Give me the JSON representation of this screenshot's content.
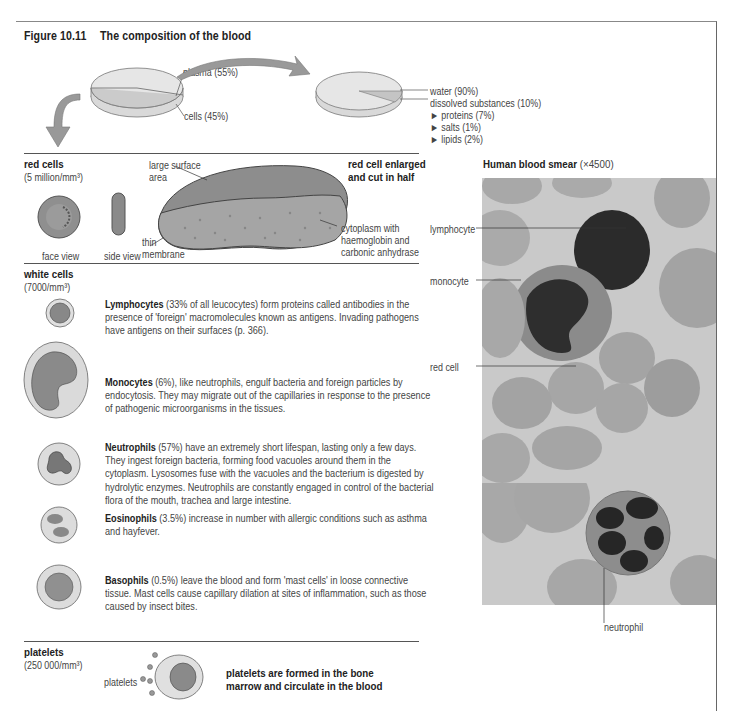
{
  "figure": {
    "number": "Figure 10.11",
    "title": "The composition of the blood"
  },
  "blood_pie": {
    "labels": [
      "plasma (55%)",
      "cells (45%)"
    ]
  },
  "plasma_pie": {
    "labels": [
      "water (90%)",
      "dissolved substances (10%)"
    ],
    "sub_items": [
      "proteins (7%)",
      "salts (1%)",
      "lipids (2%)"
    ],
    "bullet_glyph": "►"
  },
  "red_cells": {
    "heading": "red cells",
    "count": "(5 million/mm³)",
    "face_view": "face view",
    "side_view": "side view",
    "enlarged_heading_line1": "red cell enlarged",
    "enlarged_heading_line2": "and cut in half",
    "label_surface_line1": "large surface",
    "label_surface_line2": "area",
    "label_membrane_line1": "thin",
    "label_membrane_line2": "membrane",
    "label_cytoplasm_line1": "cytoplasm with",
    "label_cytoplasm_line2": "haemoglobin and",
    "label_cytoplasm_line3": "carbonic anhydrase"
  },
  "white_cells": {
    "heading": "white cells",
    "count": "(7000/mm³)",
    "types": [
      {
        "name": "Lymphocytes",
        "text": " (33% of all leucocytes) form proteins called antibodies in the presence of 'foreign' macromolecules known as antigens. Invading pathogens have antigens on their surfaces (p. 366)."
      },
      {
        "name": "Monocytes",
        "text": " (6%), like neutrophils, engulf bacteria and foreign particles by endocytosis. They may migrate out of the capillaries in response to the presence of pathogenic microorganisms in the tissues."
      },
      {
        "name": "Neutrophils",
        "text": " (57%) have an extremely short lifespan, lasting only a few days. They ingest foreign bacteria, forming food vacuoles around them in the cytoplasm. Lysosomes fuse with the vacuoles and the bacterium is digested by hydrolytic enzymes. Neutrophils are constantly engaged in control of the bacterial flora of the mouth, trachea and large intestine."
      },
      {
        "name": "Eosinophils",
        "text": " (3.5%) increase in number with allergic conditions such as asthma and hayfever."
      },
      {
        "name": "Basophils",
        "text": " (0.5%) leave the blood and form 'mast cells' in loose connective tissue. Mast cells cause capillary dilation at sites of inflammation, such as those caused by insect bites."
      }
    ]
  },
  "platelets": {
    "heading": "platelets",
    "count": "(250 000/mm³)",
    "label": "platelets",
    "caption_line1": "platelets are formed in the bone",
    "caption_line2": "marrow and circulate in the blood"
  },
  "smear": {
    "heading": "Human blood smear",
    "magnification": "(×4500)",
    "labels": {
      "lymphocyte": "lymphocyte",
      "monocyte": "monocyte",
      "red_cell": "red cell",
      "neutrophil": "neutrophil"
    }
  },
  "colors": {
    "pie_top": "#e4e4e4",
    "pie_slice": "#cfcfcf",
    "arrow": "#9a9a9a",
    "photo_bg": "#c9c9c9",
    "cell_red": "#a8a8a8",
    "nucleus": "#2a2a2a"
  }
}
